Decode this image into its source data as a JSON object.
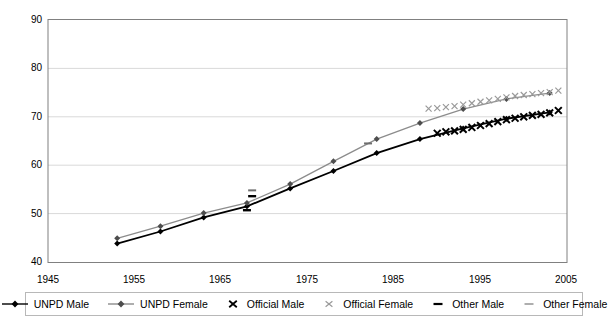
{
  "chart_data": {
    "type": "line",
    "title": "",
    "xlabel": "",
    "ylabel": "",
    "xlim": [
      1945,
      2005
    ],
    "ylim": [
      40,
      90
    ],
    "xticks": [
      1945,
      1955,
      1965,
      1975,
      1985,
      1995,
      2005
    ],
    "yticks": [
      40,
      50,
      60,
      70,
      80,
      90
    ],
    "grid": "horizontal",
    "legend_position": "bottom",
    "series": [
      {
        "name": "UNPD Male",
        "marker": "diamond",
        "color": "#000000",
        "x": [
          1953,
          1958,
          1963,
          1968,
          1973,
          1978,
          1983,
          1988,
          1993,
          1998,
          2003
        ],
        "values": [
          43.8,
          46.3,
          49.2,
          51.5,
          55.2,
          58.8,
          62.5,
          65.4,
          67.6,
          69.6,
          70.9
        ]
      },
      {
        "name": "UNPD Female",
        "marker": "diamond",
        "color": "#8c8c8c",
        "x": [
          1953,
          1958,
          1963,
          1968,
          1973,
          1978,
          1983,
          1988,
          1993,
          1998,
          2003
        ],
        "values": [
          44.9,
          47.4,
          50.1,
          52.2,
          56.1,
          60.8,
          65.4,
          68.7,
          71.6,
          73.7,
          74.9
        ]
      },
      {
        "name": "Official Male",
        "marker": "x",
        "color": "#000000",
        "x": [
          1990,
          1991,
          1992,
          1993,
          1994,
          1995,
          1996,
          1997,
          1998,
          1999,
          2000,
          2001,
          2002,
          2003,
          2004
        ],
        "values": [
          66.6,
          66.9,
          67.1,
          67.4,
          67.8,
          68.2,
          68.6,
          69.0,
          69.4,
          69.7,
          70.0,
          70.3,
          70.5,
          70.8,
          71.3
        ]
      },
      {
        "name": "Official Female",
        "marker": "x",
        "color": "#8c8c8c",
        "x": [
          1989,
          1990,
          1991,
          1992,
          1993,
          1994,
          1995,
          1996,
          1997,
          1998,
          1999,
          2000,
          2001,
          2002,
          2003,
          2004
        ],
        "values": [
          71.7,
          71.8,
          72.0,
          72.2,
          72.5,
          72.8,
          73.1,
          73.4,
          73.7,
          74.0,
          74.3,
          74.5,
          74.7,
          74.9,
          75.1,
          75.4
        ]
      },
      {
        "name": "Other Male",
        "marker": "dash",
        "color": "#000000",
        "x": [
          1968,
          1968.6
        ],
        "values": [
          50.7,
          53.6
        ]
      },
      {
        "name": "Other Female",
        "marker": "dash",
        "color": "#8c8c8c",
        "x": [
          1968.6,
          1982
        ],
        "values": [
          54.8,
          64.5
        ]
      }
    ]
  },
  "axes": {
    "y_tick_labels": [
      "90",
      "80",
      "70",
      "60",
      "50",
      "40"
    ],
    "x_tick_labels": [
      "1945",
      "1955",
      "1965",
      "1975",
      "1985",
      "1995",
      "2005"
    ]
  },
  "legend": {
    "items": [
      {
        "label": "UNPD Male",
        "marker": "line-diamond",
        "color": "#000000"
      },
      {
        "label": "UNPD Female",
        "marker": "line-diamond",
        "color": "#8c8c8c"
      },
      {
        "label": "Official Male",
        "marker": "x",
        "color": "#000000"
      },
      {
        "label": "Official Female",
        "marker": "x",
        "color": "#8c8c8c"
      },
      {
        "label": "Other Male",
        "marker": "dash",
        "color": "#000000"
      },
      {
        "label": "Other Female",
        "marker": "dash",
        "color": "#8c8c8c"
      }
    ]
  },
  "colors": {
    "plot_border": "#808080",
    "gridline": "#d9d9d9",
    "background": "#ffffff",
    "male": "#000000",
    "female": "#8c8c8c"
  }
}
